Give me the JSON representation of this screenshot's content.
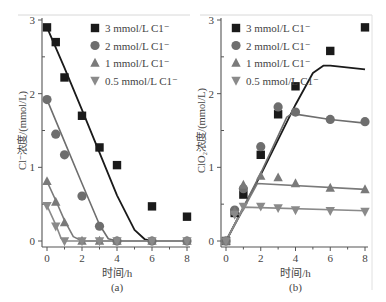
{
  "figure": {
    "caption_a": "(a)",
    "caption_b": "(b)"
  },
  "colors": {
    "s3": "#1a1a1a",
    "s2": "#6e6e6e",
    "s1": "#7a7a7a",
    "s05": "#8a8a8a",
    "axis": "#555555"
  },
  "chart_data": [
    {
      "type": "scatter",
      "panel": "(a)",
      "title": "",
      "xlabel": "时间/h",
      "ylabel": "Cl⁻浓度/(mmol/L)",
      "xlim": [
        0,
        8
      ],
      "ylim": [
        0,
        3
      ],
      "xticks": [
        "0",
        "2",
        "4",
        "6",
        "8"
      ],
      "yticks": [
        "0",
        "1",
        "2",
        "3"
      ],
      "grid": false,
      "legend_position": "upper right",
      "x": [
        0,
        0.5,
        1,
        2,
        3,
        4,
        6,
        8
      ],
      "series": [
        {
          "name": "3 mmol/L C1⁻",
          "marker": "square",
          "values": [
            2.9,
            2.7,
            2.22,
            1.7,
            1.27,
            1.03,
            0.47,
            0.33
          ],
          "fit": [
            [
              0,
              2.9
            ],
            [
              1,
              2.35
            ],
            [
              2,
              1.78
            ],
            [
              3,
              1.2
            ],
            [
              4,
              0.62
            ],
            [
              5,
              0.15
            ],
            [
              5.6,
              0.02
            ],
            [
              6,
              0
            ],
            [
              8,
              0
            ]
          ]
        },
        {
          "name": "2 mmol/L C1⁻",
          "marker": "circle",
          "values": [
            1.92,
            1.45,
            1.17,
            0.61,
            0.2,
            0,
            0,
            0
          ],
          "fit": [
            [
              0,
              1.92
            ],
            [
              1,
              1.35
            ],
            [
              2,
              0.78
            ],
            [
              3,
              0.22
            ],
            [
              3.5,
              0.03
            ],
            [
              4,
              0
            ],
            [
              8,
              0
            ]
          ]
        },
        {
          "name": "1 mmol/L C1⁻",
          "marker": "triangle-up",
          "values": [
            0.81,
            0.53,
            0.25,
            0,
            0,
            0,
            0,
            0
          ],
          "fit": [
            [
              0,
              0.81
            ],
            [
              0.5,
              0.55
            ],
            [
              1,
              0.28
            ],
            [
              1.5,
              0.06
            ],
            [
              2,
              0
            ],
            [
              8,
              0
            ]
          ]
        },
        {
          "name": "0.5 mmol/L C1⁻",
          "marker": "triangle-down",
          "values": [
            0.48,
            0.2,
            0,
            0,
            0,
            0,
            0,
            0
          ],
          "fit": [
            [
              0,
              0.48
            ],
            [
              0.5,
              0.22
            ],
            [
              0.8,
              0.04
            ],
            [
              1,
              0
            ],
            [
              8,
              0
            ]
          ]
        }
      ]
    },
    {
      "type": "scatter",
      "panel": "(b)",
      "title": "",
      "xlabel": "时间/h",
      "ylabel": "ClO₂浓度/(mmol/L)",
      "xlim": [
        0,
        8
      ],
      "ylim": [
        0,
        3
      ],
      "xticks": [
        "0",
        "2",
        "4",
        "6",
        "8"
      ],
      "yticks": [
        "0",
        "1",
        "2",
        "3"
      ],
      "grid": false,
      "legend_position": "upper left",
      "x": [
        0,
        0.5,
        1,
        2,
        3,
        4,
        6,
        8
      ],
      "series": [
        {
          "name": "3 mmol/L C1⁻",
          "marker": "square",
          "values": [
            0,
            0.38,
            0.63,
            1.17,
            1.72,
            2.1,
            2.58,
            2.9
          ],
          "fit": [
            [
              0,
              0
            ],
            [
              2,
              0.9
            ],
            [
              4,
              1.85
            ],
            [
              5,
              2.28
            ],
            [
              5.6,
              2.38
            ],
            [
              6,
              2.38
            ],
            [
              8,
              2.33
            ]
          ]
        },
        {
          "name": "2 mmol/L C1⁻",
          "marker": "circle",
          "values": [
            0,
            0.42,
            0.71,
            1.28,
            1.82,
            1.75,
            1.65,
            1.62
          ],
          "fit": [
            [
              0,
              0
            ],
            [
              2,
              0.92
            ],
            [
              3.5,
              1.68
            ],
            [
              3.8,
              1.73
            ],
            [
              6,
              1.65
            ],
            [
              8,
              1.6
            ]
          ]
        },
        {
          "name": "1 mmol/L C1⁻",
          "marker": "triangle-up",
          "values": [
            0,
            0.4,
            0.76,
            0.88,
            0.86,
            0.78,
            0.72,
            0.7
          ],
          "fit": [
            [
              0,
              0
            ],
            [
              1.8,
              0.78
            ],
            [
              8,
              0.7
            ]
          ]
        },
        {
          "name": "0.5 mmol/L C1⁻",
          "marker": "triangle-down",
          "values": [
            0,
            0.36,
            0.47,
            0.47,
            0.45,
            0.42,
            0.41,
            0.4
          ],
          "fit": [
            [
              0,
              0
            ],
            [
              1,
              0.46
            ],
            [
              8,
              0.41
            ]
          ]
        }
      ]
    }
  ]
}
